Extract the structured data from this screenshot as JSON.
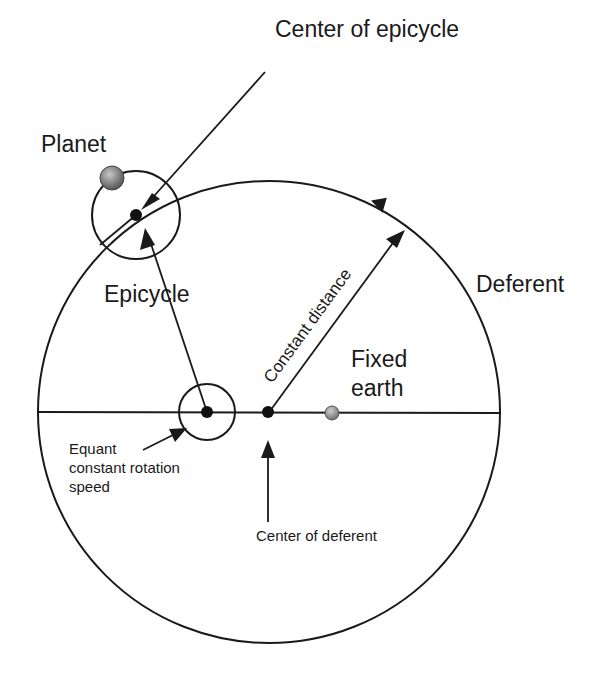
{
  "diagram": {
    "labels": {
      "center_of_epicycle": "Center of epicycle",
      "planet": "Planet",
      "epicycle": "Epicycle",
      "deferent": "Deferent",
      "constant_distance": "Constant distance",
      "fixed_earth_line1": "Fixed",
      "fixed_earth_line2": "earth",
      "equant_line1": "Equant",
      "equant_line2": "constant rotation",
      "equant_line3": "speed",
      "center_of_deferent": "Center of deferent"
    },
    "colors": {
      "line": "#1a1a1a",
      "planet_fill": "#7a7a7a",
      "earth_fill": "#8f8f8f",
      "background": "#ffffff"
    }
  }
}
